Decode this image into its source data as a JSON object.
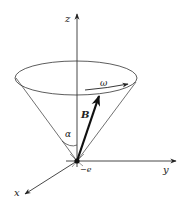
{
  "diagram": {
    "axes": {
      "z_label": "z",
      "y_label": "y",
      "x_label": "x"
    },
    "vector_label": "B",
    "angular_velocity_label": "ω",
    "angle_label": "α",
    "charge_label": "−e",
    "colors": {
      "line": "#222222",
      "background": "#ffffff"
    }
  }
}
